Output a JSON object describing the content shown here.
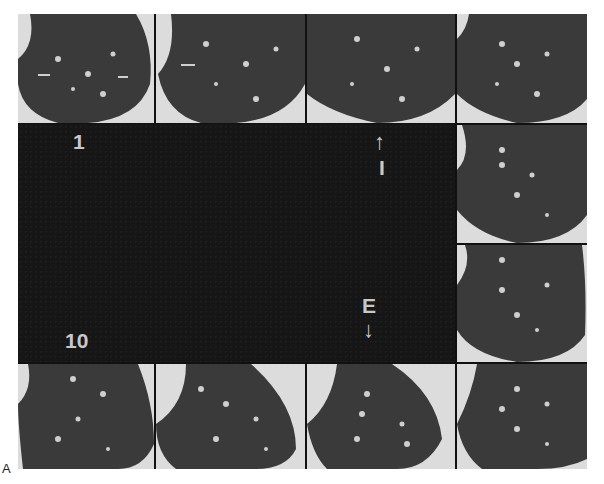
{
  "figure": {
    "panel_letter": "A",
    "colors": {
      "lung_tissue": "#3a3a3a",
      "background": "#dcdcdc",
      "grid_lines": "#111111",
      "labels": "#c8c8c8"
    }
  },
  "center_panel": {
    "label_top_left": "1",
    "label_bottom_left": "10",
    "label_inspiration": "I",
    "label_expiration": "E",
    "arrow_up": "↑",
    "arrow_down": "↓"
  },
  "slices": [
    {
      "row": 0,
      "col": 0
    },
    {
      "row": 0,
      "col": 1
    },
    {
      "row": 0,
      "col": 2
    },
    {
      "row": 0,
      "col": 3
    },
    {
      "row": 1,
      "col": 3
    },
    {
      "row": 2,
      "col": 3
    },
    {
      "row": 3,
      "col": 0
    },
    {
      "row": 3,
      "col": 1
    },
    {
      "row": 3,
      "col": 2
    },
    {
      "row": 3,
      "col": 3
    }
  ]
}
